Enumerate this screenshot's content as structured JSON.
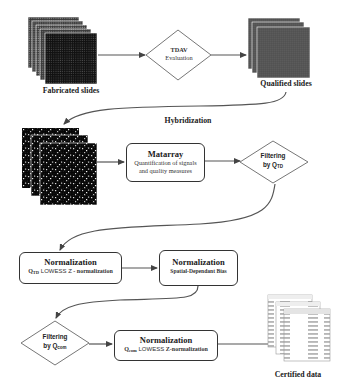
{
  "diagram": {
    "type": "flowchart",
    "nodes": {
      "fabricated_slides": {
        "label": "Fabricated slides",
        "shape": "image-stack"
      },
      "tdav": {
        "title": "TDAV",
        "subtitle": "Evaluation",
        "shape": "diamond"
      },
      "qualified_slides": {
        "label": "Qualified slides",
        "shape": "image-stack"
      },
      "hybridization": {
        "label": "Hybridization",
        "shape": "edge-label"
      },
      "hybridized_slides": {
        "shape": "image-stack"
      },
      "matarray": {
        "title": "Matarray",
        "line1": "Quantification of signals",
        "line2": "and quality measures",
        "shape": "rounded-box"
      },
      "filter_qtd": {
        "line1": "Filtering",
        "line2_prefix": "by Q",
        "line2_sub": "TD",
        "shape": "diamond"
      },
      "norm_lowess": {
        "title": "Normalization",
        "q": "Q",
        "q_sub": "TD",
        "rest_sans": " LOWESS Z",
        "rest_serif": " - normalization",
        "shape": "rounded-box"
      },
      "norm_spatial": {
        "title": "Normalization",
        "subtitle": "Spatial-Dependant Bias",
        "shape": "rounded-box"
      },
      "filter_qcom": {
        "line1": "Filtering",
        "line2_prefix": "by Q",
        "line2_sub": "com",
        "shape": "diamond"
      },
      "norm_qcom": {
        "title": "Normalization",
        "q": "Q",
        "q_sub": "com",
        "rest_sans": " LOWESS ",
        "rest_serif": "Z-normalization",
        "shape": "rounded-box"
      },
      "certified_data": {
        "label": "Certified data",
        "shape": "table-stack"
      }
    },
    "edges": [
      {
        "from": "fabricated_slides",
        "to": "tdav"
      },
      {
        "from": "tdav",
        "to": "qualified_slides"
      },
      {
        "from": "qualified_slides",
        "to": "hybridized_slides",
        "label": "Hybridization"
      },
      {
        "from": "hybridized_slides",
        "to": "matarray"
      },
      {
        "from": "matarray",
        "to": "filter_qtd"
      },
      {
        "from": "filter_qtd",
        "to": "norm_lowess"
      },
      {
        "from": "norm_lowess",
        "to": "norm_spatial"
      },
      {
        "from": "norm_spatial",
        "to": "filter_qcom"
      },
      {
        "from": "filter_qcom",
        "to": "norm_qcom"
      },
      {
        "from": "norm_qcom",
        "to": "certified_data"
      }
    ],
    "colors": {
      "line": "#555555",
      "border": "#333333",
      "text": "#1a1a1a",
      "background": "#ffffff"
    }
  }
}
